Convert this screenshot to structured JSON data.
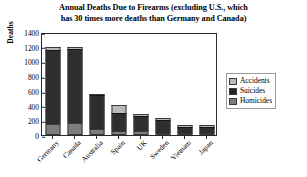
{
  "chart_data": {
    "type": "bar",
    "subtype": "stacked",
    "title": "Annual Deaths Due to Firearms (excluding U.S., which has 30 times more deaths than Germany and Canada)",
    "title_lines": [
      "Annual Deaths Due to Firearms (excluding U.S., which",
      "has 30 times more deaths than Germany and Canada)"
    ],
    "xlabel": "",
    "ylabel": "Deaths",
    "ylim": [
      0,
      1400
    ],
    "ytick_step": 200,
    "yticks": [
      0,
      200,
      400,
      600,
      800,
      1000,
      1200,
      1400
    ],
    "ytick_labels": [
      "0",
      "200",
      "400",
      "600",
      "800",
      "1000",
      "1200",
      "1400"
    ],
    "grid": false,
    "legend_position": "right",
    "categories": [
      "Germany",
      "Canada",
      "Australia",
      "Spain",
      "UK",
      "Sweden",
      "Vietnam",
      "Japan"
    ],
    "series": [
      {
        "name": "Homicides",
        "color": "#7d7d7d",
        "values": [
          150,
          170,
          85,
          55,
          60,
          20,
          15,
          10
        ]
      },
      {
        "name": "Suicides",
        "color": "#2e2e2e",
        "values": [
          1010,
          1000,
          455,
          250,
          205,
          180,
          85,
          85
        ]
      },
      {
        "name": "Accidents",
        "color": "#b9b9b9",
        "values": [
          40,
          30,
          10,
          100,
          10,
          5,
          25,
          5
        ]
      }
    ],
    "totals": [
      1200,
      1200,
      550,
      405,
      275,
      205,
      125,
      100
    ]
  },
  "legend": {
    "items": [
      {
        "label": "Accidents",
        "swatch": "sw-accidents"
      },
      {
        "label": "Suicides",
        "swatch": "sw-suicides"
      },
      {
        "label": "Homicides",
        "swatch": "sw-homicides"
      }
    ]
  }
}
